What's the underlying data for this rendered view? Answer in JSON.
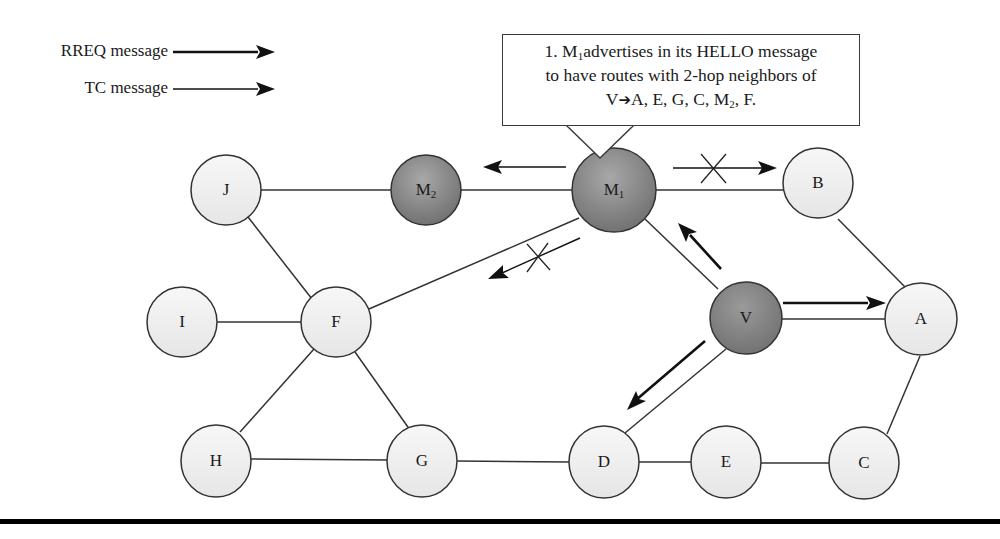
{
  "legend": {
    "items": [
      {
        "label": "RREQ message",
        "style": "thick-arrow"
      },
      {
        "label": "TC message",
        "style": "thin-arrow"
      }
    ]
  },
  "callout": {
    "line1_pre": "1. M",
    "line1_sub": "1",
    "line1_post": "advertises in its HELLO message",
    "line2": "to have routes with 2-hop neighbors of",
    "line3_pre": "V",
    "line3_arrow": "➔",
    "line3_mid": "A, E, G, C, M",
    "line3_sub": "2",
    "line3_post": ", F."
  },
  "colors": {
    "normal_node_fill": "#efefef",
    "malicious_node_fill": "#8a8a8a",
    "stroke": "#333333",
    "bottom_rule": "#000000"
  },
  "nodes": [
    {
      "id": "J",
      "label": "J",
      "sub": "",
      "type": "normal"
    },
    {
      "id": "M2",
      "label": "M",
      "sub": "2",
      "type": "malicious"
    },
    {
      "id": "M1",
      "label": "M",
      "sub": "1",
      "type": "malicious"
    },
    {
      "id": "B",
      "label": "B",
      "sub": "",
      "type": "normal"
    },
    {
      "id": "I",
      "label": "I",
      "sub": "",
      "type": "normal"
    },
    {
      "id": "F",
      "label": "F",
      "sub": "",
      "type": "normal"
    },
    {
      "id": "V",
      "label": "V",
      "sub": "",
      "type": "source"
    },
    {
      "id": "A",
      "label": "A",
      "sub": "",
      "type": "normal"
    },
    {
      "id": "H",
      "label": "H",
      "sub": "",
      "type": "normal"
    },
    {
      "id": "G",
      "label": "G",
      "sub": "",
      "type": "normal"
    },
    {
      "id": "D",
      "label": "D",
      "sub": "",
      "type": "normal"
    },
    {
      "id": "E",
      "label": "E",
      "sub": "",
      "type": "normal"
    },
    {
      "id": "C",
      "label": "C",
      "sub": "",
      "type": "normal"
    }
  ],
  "edges": [
    [
      "J",
      "M2"
    ],
    [
      "M2",
      "M1"
    ],
    [
      "M1",
      "B"
    ],
    [
      "J",
      "F"
    ],
    [
      "I",
      "F"
    ],
    [
      "F",
      "M1"
    ],
    [
      "M1",
      "V"
    ],
    [
      "B",
      "A"
    ],
    [
      "V",
      "A"
    ],
    [
      "F",
      "H"
    ],
    [
      "F",
      "G"
    ],
    [
      "H",
      "G"
    ],
    [
      "G",
      "D"
    ],
    [
      "D",
      "E"
    ],
    [
      "E",
      "C"
    ],
    [
      "V",
      "D"
    ],
    [
      "A",
      "C"
    ]
  ],
  "messages": [
    {
      "from": "M1",
      "to": "M2",
      "type": "TC",
      "blocked": false
    },
    {
      "from": "M1",
      "to": "B",
      "type": "TC",
      "blocked": true
    },
    {
      "from": "M1",
      "to": "F",
      "type": "TC",
      "blocked": true
    },
    {
      "from": "V",
      "to": "M1",
      "type": "RREQ",
      "blocked": false
    },
    {
      "from": "V",
      "to": "A",
      "type": "RREQ",
      "blocked": false
    },
    {
      "from": "V",
      "to": "D",
      "type": "RREQ",
      "blocked": false
    }
  ]
}
